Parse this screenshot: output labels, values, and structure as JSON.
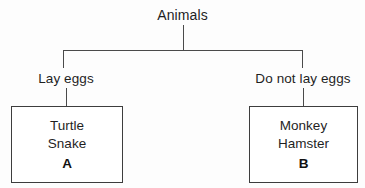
{
  "diagram": {
    "type": "classification-tree",
    "root": {
      "label": "Animals"
    },
    "branches": [
      {
        "label": "Lay eggs",
        "group": {
          "tag": "A",
          "members": [
            "Turtle",
            "Snake"
          ]
        }
      },
      {
        "label": "Do not lay eggs",
        "group": {
          "tag": "B",
          "members": [
            "Monkey",
            "Hamster"
          ]
        }
      }
    ],
    "colors": {
      "background": "#fdfdfd",
      "line": "#4a4a4a",
      "box_border": "#3d3d3d",
      "box_fill": "#ffffff",
      "text": "#1f1f1f"
    }
  }
}
